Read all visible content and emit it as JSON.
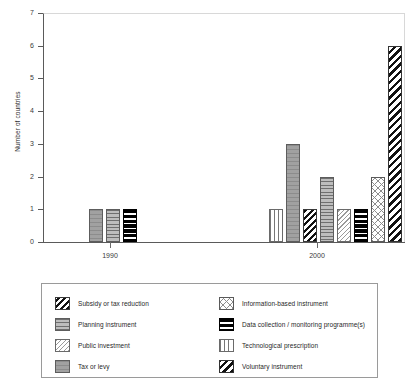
{
  "chart_data": {
    "type": "bar",
    "title": "",
    "xlabel": "",
    "ylabel": "Number of countries",
    "ylim": [
      0,
      7
    ],
    "yticks": [
      0,
      1,
      2,
      3,
      4,
      5,
      6,
      7
    ],
    "categories": [
      "1990",
      "2000"
    ],
    "grid": false,
    "legend_position": "below-plot",
    "series": [
      {
        "name": "Subsidy or tax reduction",
        "key": "subsidy",
        "pattern": "diagonal-stripes-black",
        "values": [
          0,
          1
        ]
      },
      {
        "name": "Planning instrument",
        "key": "planning",
        "pattern": "horizontal-lines-gray",
        "values": [
          1,
          2
        ]
      },
      {
        "name": "Public investment",
        "key": "public",
        "pattern": "light-diagonal-hatch",
        "values": [
          0,
          1
        ]
      },
      {
        "name": "Tax or levy",
        "key": "tax",
        "pattern": "solid-gray",
        "values": [
          1,
          3
        ]
      },
      {
        "name": "Information-based instrument",
        "key": "info",
        "pattern": "cross-hatch",
        "values": [
          0,
          2
        ]
      },
      {
        "name": "Data collection / monitoring programme(s)",
        "key": "data",
        "pattern": "black-horizontal-bands",
        "values": [
          1,
          1
        ]
      },
      {
        "name": "Technological prescription",
        "key": "tech",
        "pattern": "vertical-lines",
        "values": [
          0,
          1
        ]
      },
      {
        "name": "Voluntary instrument",
        "key": "voluntary",
        "pattern": "diagonal-hatch-black",
        "values": [
          0,
          6
        ]
      }
    ],
    "bars_1990": [
      {
        "series": "Tax or levy",
        "value": 1
      },
      {
        "series": "Planning instrument",
        "value": 1
      },
      {
        "series": "Data collection / monitoring programme(s)",
        "value": 1
      }
    ],
    "bars_2000": [
      {
        "series": "Technological prescription",
        "value": 1
      },
      {
        "series": "Tax or levy",
        "value": 3
      },
      {
        "series": "Subsidy or tax reduction",
        "value": 1
      },
      {
        "series": "Planning instrument",
        "value": 2
      },
      {
        "series": "Public investment",
        "value": 1
      },
      {
        "series": "Data collection / monitoring programme(s)",
        "value": 1
      },
      {
        "series": "Information-based instrument",
        "value": 2
      },
      {
        "series": "Voluntary instrument",
        "value": 6
      }
    ]
  },
  "axis": {
    "y_title": "Number of countries",
    "y_labels": [
      "0",
      "1",
      "2",
      "3",
      "4",
      "5",
      "6",
      "7"
    ],
    "x_labels": [
      "1990",
      "2000"
    ]
  },
  "legend": {
    "left": [
      {
        "label": "Subsidy or tax reduction"
      },
      {
        "label": "Planning instrument"
      },
      {
        "label": "Public investment"
      },
      {
        "label": "Tax or levy"
      }
    ],
    "right": [
      {
        "label": "Information-based instrument"
      },
      {
        "label": "Data collection / monitoring programme(s)"
      },
      {
        "label": "Technological prescription"
      },
      {
        "label": "Voluntary instrument"
      }
    ]
  }
}
